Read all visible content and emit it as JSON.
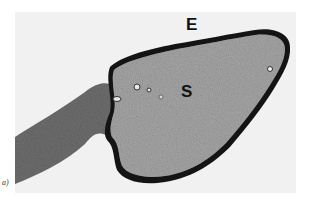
{
  "figure": {
    "panel_caption": "a)",
    "labels": {
      "epithelium": "E",
      "stroma": "S"
    },
    "colors": {
      "background": "#f1f1f1",
      "tissue_fill": "#9a9a9a",
      "tissue_edge": "#141414",
      "stalk": "#6e6e6e"
    }
  }
}
